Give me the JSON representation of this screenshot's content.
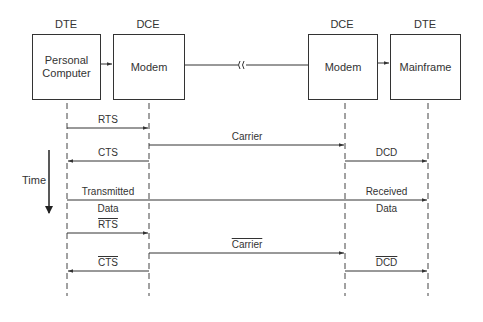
{
  "diagram": {
    "type": "sequence/timing diagram",
    "entities": [
      {
        "role": "DTE",
        "label": "Personal\nComputer"
      },
      {
        "role": "DCE",
        "label": "Modem"
      },
      {
        "role": "DCE",
        "label": "Modem"
      },
      {
        "role": "DTE",
        "label": "Mainframe"
      }
    ],
    "time_axis_label": "Time",
    "signals": [
      {
        "label": "RTS",
        "from": 0,
        "to": 1,
        "negated": false
      },
      {
        "label": "Carrier",
        "from": 1,
        "to": 2,
        "negated": false
      },
      {
        "label": "CTS",
        "from": 1,
        "to": 0,
        "negated": false
      },
      {
        "label": "DCD",
        "from": 2,
        "to": 3,
        "negated": false
      },
      {
        "label_left_top": "Transmitted",
        "label_left_bottom": "Data",
        "label_right_top": "Received",
        "label_right_bottom": "Data",
        "from": 0,
        "to": 3
      },
      {
        "label": "RTS",
        "from": 0,
        "to": 1,
        "negated": true
      },
      {
        "label": "Carrier",
        "from": 1,
        "to": 2,
        "negated": true
      },
      {
        "label": "CTS",
        "from": 1,
        "to": 0,
        "negated": true
      },
      {
        "label": "DCD",
        "from": 2,
        "to": 3,
        "negated": true
      }
    ],
    "link_break_symbol": "≀≀",
    "colors": {
      "line": "#333333",
      "background": "#ffffff"
    }
  }
}
